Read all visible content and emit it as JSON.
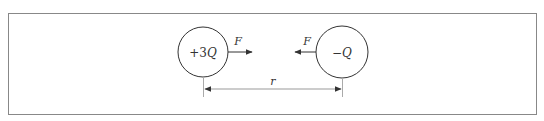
{
  "figure": {
    "type": "coulomb-force-diagram",
    "frame": {
      "x": 8,
      "y": 13,
      "width": 528,
      "height": 101,
      "stroke": "#888888"
    },
    "colors": {
      "stroke": "#333333",
      "frame": "#888888",
      "guide": "#aaaaaa",
      "background": "#ffffff"
    },
    "charges": [
      {
        "id": "left",
        "label_prefix": "+3",
        "label_var": "Q",
        "cx": 203,
        "cy": 52,
        "r": 25
      },
      {
        "id": "right",
        "label_prefix": "−",
        "label_var": "Q",
        "cx": 342,
        "cy": 52,
        "r": 26
      }
    ],
    "forces": [
      {
        "id": "force-on-left",
        "label": "F",
        "direction": "right",
        "x1": 228,
        "x2": 252,
        "y": 52
      },
      {
        "id": "force-on-right",
        "label": "F",
        "direction": "left",
        "x1": 316,
        "x2": 295,
        "y": 52
      }
    ],
    "distance": {
      "label": "r",
      "x1": 205,
      "x2": 342,
      "y": 89
    }
  }
}
